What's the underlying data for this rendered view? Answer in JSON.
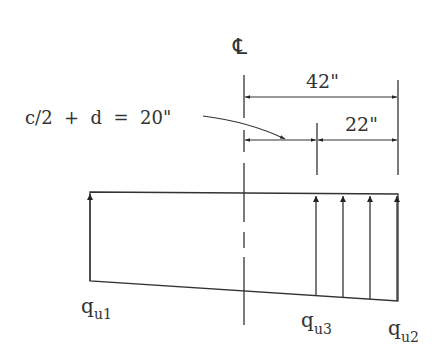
{
  "diagram": {
    "centerline_symbol": "℄",
    "dimensions": {
      "total": "42\"",
      "outer": "22\"",
      "inner_label": "c/2  +  d  =  20\""
    },
    "labels": {
      "q1_main": "q",
      "q1_sub": "u1",
      "q3_main": "q",
      "q3_sub": "u3",
      "q2_main": "q",
      "q2_sub": "u2"
    },
    "colors": {
      "line": "#333333",
      "background": "#ffffff"
    }
  }
}
